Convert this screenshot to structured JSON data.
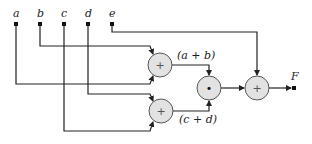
{
  "diagram": {
    "title": "",
    "colors": {
      "wire": "#222222",
      "node_fill": "#e2e2e2",
      "node_stroke": "#555555",
      "terminal": "#111111",
      "text": "#222222"
    },
    "inputs": [
      {
        "id": "a",
        "label": "a"
      },
      {
        "id": "b",
        "label": "b"
      },
      {
        "id": "c",
        "label": "c"
      },
      {
        "id": "d",
        "label": "d"
      },
      {
        "id": "e",
        "label": "e"
      }
    ],
    "operators": [
      {
        "id": "add1",
        "symbol": "+",
        "inputs": [
          "b",
          "a"
        ]
      },
      {
        "id": "add2",
        "symbol": "+",
        "inputs": [
          "d",
          "c"
        ]
      },
      {
        "id": "mul",
        "symbol": "•",
        "inputs": [
          "add1",
          "add2"
        ]
      },
      {
        "id": "add3",
        "symbol": "+",
        "inputs": [
          "e",
          "mul"
        ]
      }
    ],
    "edge_labels": {
      "sum_ab": "(a + b)",
      "sum_cd": "(c + d)"
    },
    "output": {
      "id": "F",
      "label": "F"
    }
  }
}
